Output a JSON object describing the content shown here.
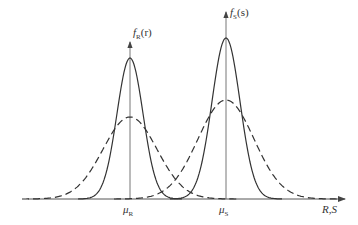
{
  "diagram": {
    "labels": {
      "fR": {
        "f": "f",
        "sub": "R",
        "arg": "(r)"
      },
      "fS": {
        "f": "f",
        "sub": "S",
        "arg": "(s)"
      },
      "muR": {
        "mu": "μ",
        "sub": "R"
      },
      "muS": {
        "mu": "μ",
        "sub": "S"
      },
      "xaxis": "R,S"
    },
    "colors": {
      "stroke": "#333333",
      "axis": "#555555",
      "background": "#ffffff"
    }
  },
  "chart_data": {
    "type": "line",
    "title": "",
    "xlabel": "R,S",
    "ylabel": "",
    "series": [
      {
        "name": "f_R(r) solid (narrow)",
        "style": "solid",
        "mean_px": 130,
        "sigma_px": 13,
        "peak_y_px": 58
      },
      {
        "name": "f_R(r) dashed (wide)",
        "style": "dashed",
        "mean_px": 130,
        "sigma_px": 27,
        "peak_y_px": 117
      },
      {
        "name": "f_S(s) solid (narrow)",
        "style": "solid",
        "mean_px": 226,
        "sigma_px": 14,
        "peak_y_px": 38
      },
      {
        "name": "f_S(s) dashed (wide)",
        "style": "dashed",
        "mean_px": 226,
        "sigma_px": 28,
        "peak_y_px": 100
      }
    ],
    "x_ticks": [
      "μR",
      "μS"
    ],
    "baseline_y_px": 199
  }
}
